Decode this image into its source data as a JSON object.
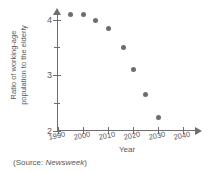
{
  "chart_data": {
    "type": "scatter",
    "title": "",
    "xlabel": "Year",
    "ylabel": "Ratio of working-age population to the elderly",
    "ylabel_lines": [
      "Ratio of working-age",
      "population to the elderly"
    ],
    "xlim": [
      1990,
      2042
    ],
    "ylim": [
      2,
      4.2
    ],
    "grid": false,
    "legend": null,
    "x_ticks": [
      1990,
      2000,
      2010,
      2020,
      2030,
      2040
    ],
    "x_tick_labels": [
      "1990",
      "2000",
      "2010",
      "2020",
      "2030",
      "2040"
    ],
    "y_ticks": [
      2,
      3,
      4
    ],
    "y_tick_labels": [
      "2",
      "3",
      "4"
    ],
    "y_minor_ticks": [
      2.5,
      3.5
    ],
    "x": [
      1995,
      2000,
      2005,
      2010,
      2016,
      2020,
      2025,
      2030
    ],
    "values": [
      4.1,
      4.1,
      4.0,
      3.85,
      3.5,
      3.1,
      2.65,
      2.25
    ],
    "points": [
      {
        "x": 1995,
        "y": 4.1
      },
      {
        "x": 2000,
        "y": 4.1
      },
      {
        "x": 2005,
        "y": 4.0
      },
      {
        "x": 2010,
        "y": 3.85
      },
      {
        "x": 2016,
        "y": 3.5
      },
      {
        "x": 2020,
        "y": 3.1
      },
      {
        "x": 2025,
        "y": 2.65
      },
      {
        "x": 2030,
        "y": 2.25
      }
    ],
    "marker_color": "#6d6d70",
    "axis_color": "#6e6e70",
    "text_color": "#58585a"
  },
  "source": {
    "prefix": "(Source: ",
    "publication": "Newsweek",
    "suffix": ")"
  }
}
